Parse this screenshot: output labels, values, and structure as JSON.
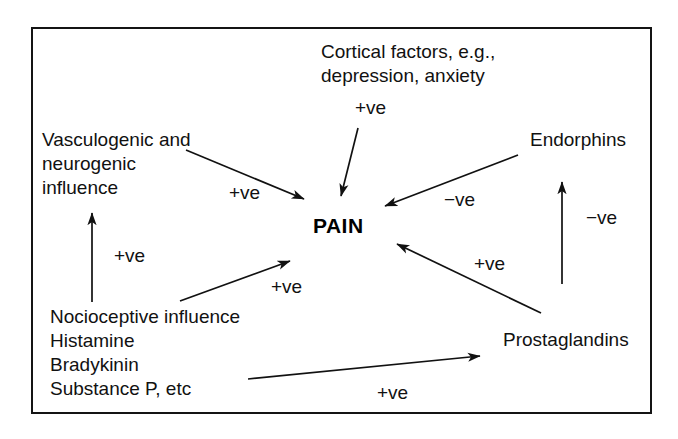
{
  "diagram": {
    "title_text": "PAIN",
    "frame": {
      "border_color": "#141414"
    },
    "nodes": [
      {
        "id": "cortical",
        "label": "Cortical factors, e.g.,\ndepression, anxiety",
        "x": 321,
        "y": 40,
        "align": "left"
      },
      {
        "id": "vasculogenic",
        "label": "Vasculogenic and\nneurogenic\ninfluence",
        "x": 42,
        "y": 128,
        "align": "left"
      },
      {
        "id": "endorphins",
        "label": "Endorphins",
        "x": 530,
        "y": 128,
        "align": "left"
      },
      {
        "id": "nociceptive",
        "label": "Nocioceptive influence\nHistamine\nBradykinin\nSubstance P, etc",
        "x": 50,
        "y": 305,
        "align": "left"
      },
      {
        "id": "prostaglandins",
        "label": "Prostaglandins",
        "x": 503,
        "y": 328,
        "align": "left"
      }
    ],
    "center": {
      "id": "pain",
      "label": "PAIN",
      "x": 313,
      "y": 214
    },
    "edges": [
      {
        "id": "cortical-to-pain",
        "from": "cortical",
        "to": "pain",
        "sign": "+ve",
        "sign_x": 355,
        "sign_y": 98,
        "x1": 358,
        "y1": 128,
        "x2": 341,
        "y2": 196
      },
      {
        "id": "vasculogenic-to-pain",
        "from": "vasculogenic",
        "to": "pain",
        "sign": "+ve",
        "sign_x": 229,
        "sign_y": 183,
        "x1": 186,
        "y1": 150,
        "x2": 304,
        "y2": 199
      },
      {
        "id": "endorphins-to-pain",
        "from": "endorphins",
        "to": "pain",
        "sign": "−ve",
        "sign_x": 444,
        "sign_y": 190,
        "x1": 518,
        "y1": 155,
        "x2": 385,
        "y2": 206
      },
      {
        "id": "prostaglandins-to-pain",
        "from": "prostaglandins",
        "to": "pain",
        "sign": "+ve",
        "sign_x": 474,
        "sign_y": 254,
        "x1": 541,
        "y1": 313,
        "x2": 397,
        "y2": 244
      },
      {
        "id": "nociceptive-to-pain",
        "from": "nociceptive",
        "to": "pain",
        "sign": "+ve",
        "sign_x": 271,
        "sign_y": 277,
        "x1": 180,
        "y1": 301,
        "x2": 290,
        "y2": 261
      },
      {
        "id": "nociceptive-to-vasculogenic",
        "from": "nociceptive",
        "to": "vasculogenic",
        "sign": "+ve",
        "sign_x": 114,
        "sign_y": 246,
        "x1": 92,
        "y1": 302,
        "x2": 92,
        "y2": 213
      },
      {
        "id": "nociceptive-to-prostaglandins",
        "from": "nociceptive",
        "to": "prostaglandins",
        "sign": "+ve",
        "sign_x": 377,
        "sign_y": 383,
        "x1": 248,
        "y1": 379,
        "x2": 480,
        "y2": 356
      },
      {
        "id": "prostaglandins-to-endorphins",
        "from": "prostaglandins",
        "to": "endorphins",
        "sign": "−ve",
        "sign_x": 586,
        "sign_y": 208,
        "x1": 562,
        "y1": 284,
        "x2": 562,
        "y2": 182
      }
    ]
  }
}
